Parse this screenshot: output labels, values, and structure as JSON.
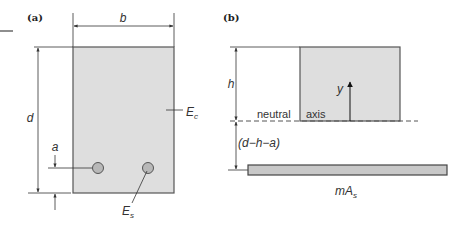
{
  "diagram": {
    "panel_a": {
      "label": "(a)",
      "width_label": "b",
      "depth_label": "d",
      "cover_label": "a",
      "concrete_label": "E",
      "concrete_sub": "c",
      "steel_label": "E",
      "steel_sub": "s"
    },
    "panel_b": {
      "label": "(b)",
      "height_label": "h",
      "y_label": "y",
      "neutral_label": "neutral",
      "axis_label": "axis",
      "gap_label": "(d−h−a)",
      "steel_area_label": "mA",
      "steel_area_sub": "s"
    },
    "colors": {
      "fill": "#dedede",
      "bar_fill": "#c8c8c8",
      "stroke": "#555555"
    }
  }
}
